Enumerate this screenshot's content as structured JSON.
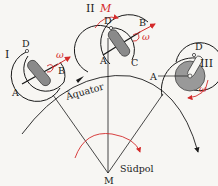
{
  "diagram": {
    "labels": {
      "equator": "Äquator",
      "south_pole": "Südpol",
      "center": "M",
      "torque": "M",
      "omega": "ω",
      "omega_vec": "ω⃗"
    },
    "positions": [
      {
        "id": "I",
        "label": "I",
        "points": {
          "A": "A",
          "B": "B",
          "D": "D"
        }
      },
      {
        "id": "II",
        "label": "II",
        "points": {
          "A": "A",
          "B": "B",
          "C": "C",
          "D": "D"
        }
      },
      {
        "id": "III",
        "label": "III",
        "points": {
          "A": "A",
          "D": "D"
        }
      }
    ],
    "colors": {
      "line": "#1a1a1a",
      "accent": "#d42a2a",
      "rotor": "#8a8a8a",
      "disc": "#999999"
    }
  }
}
